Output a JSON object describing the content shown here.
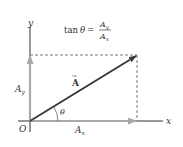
{
  "diagram": {
    "formula": {
      "lhs": "tan",
      "theta": "θ",
      "equals": "=",
      "numerator": "A",
      "numerator_sub": "y",
      "denominator": "A",
      "denominator_sub": "x"
    },
    "axes": {
      "x_label": "x",
      "y_label": "y",
      "origin_label": "O"
    },
    "vector": {
      "label": "A",
      "arrow_symbol": "→"
    },
    "components": {
      "ax_label": "A",
      "ax_sub": "x",
      "ay_label": "A",
      "ay_sub": "y"
    },
    "angle_label": "θ",
    "colors": {
      "axis": "#333333",
      "vector": "#3a3a3a",
      "component": "#a8a8a8",
      "dashed": "#777777"
    }
  }
}
